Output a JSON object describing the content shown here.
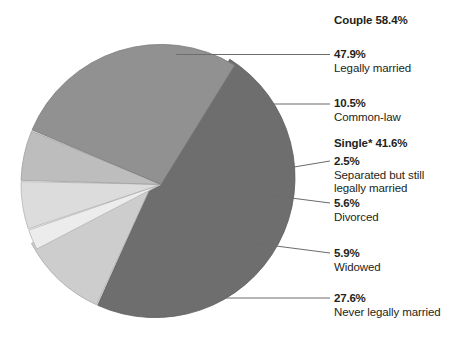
{
  "chart_data": {
    "type": "pie",
    "title": "",
    "xlabel": "",
    "ylabel": "",
    "legend_position": "right-callouts",
    "grid": false,
    "groups": [
      {
        "name": "Couple",
        "label": "Couple 58.4%",
        "value": 58.4
      },
      {
        "name": "Single",
        "label": "Single* 41.6%",
        "value": 41.6
      }
    ],
    "categories": [
      "Legally married",
      "Common-law",
      "Separated but still legally married",
      "Divorced",
      "Widowed",
      "Never legally married"
    ],
    "values": [
      47.9,
      10.5,
      2.5,
      5.6,
      5.9,
      27.6
    ],
    "colors": [
      "#6e6e6e",
      "#cdcdcd",
      "#ececec",
      "#dcdcdc",
      "#bdbdbd",
      "#919191"
    ],
    "slices": [
      {
        "pct": "47.9%",
        "desc": "Legally married",
        "value": 47.9,
        "color": "#6e6e6e",
        "group": "Couple"
      },
      {
        "pct": "10.5%",
        "desc": "Common-law",
        "value": 10.5,
        "color": "#cdcdcd",
        "group": "Couple"
      },
      {
        "pct": "2.5%",
        "desc": "Separated but still legally married",
        "desc_line1": "Separated but still",
        "desc_line2": "legally married",
        "value": 2.5,
        "color": "#ececec",
        "group": "Single"
      },
      {
        "pct": "5.6%",
        "desc": "Divorced",
        "value": 5.6,
        "color": "#dcdcdc",
        "group": "Single"
      },
      {
        "pct": "5.9%",
        "desc": "Widowed",
        "value": 5.9,
        "color": "#bdbdbd",
        "group": "Single"
      },
      {
        "pct": "27.6%",
        "desc": "Never legally married",
        "value": 27.6,
        "color": "#919191",
        "group": "Single"
      }
    ]
  },
  "labels": {
    "couple_heading": "Couple 58.4%",
    "single_heading": "Single* 41.6%",
    "married_pct": "47.9%",
    "married_desc": "Legally married",
    "commonlaw_pct": "10.5%",
    "commonlaw_desc": "Common-law",
    "separated_pct": "2.5%",
    "separated_desc_line1": "Separated but still",
    "separated_desc_line2": "legally married",
    "divorced_pct": "5.6%",
    "divorced_desc": "Divorced",
    "widowed_pct": "5.9%",
    "widowed_desc": "Widowed",
    "never_pct": "27.6%",
    "never_desc": "Never legally married"
  }
}
